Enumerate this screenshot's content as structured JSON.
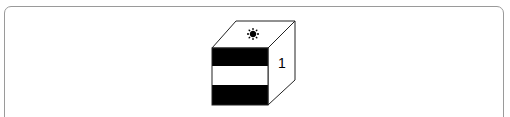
{
  "figure": {
    "cube": {
      "top_face_icon": "sun-icon",
      "side_face_label": "1",
      "front_face_pattern": [
        "black",
        "white",
        "black"
      ]
    }
  },
  "colors": {
    "border": "#9a9a9a",
    "stroke": "#222222",
    "fill_dark": "#000000",
    "fill_light": "#ffffff"
  }
}
